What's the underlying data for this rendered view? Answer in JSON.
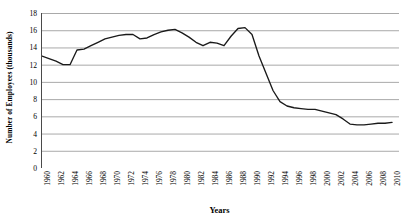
{
  "chart_data": {
    "type": "line",
    "title": "",
    "xlabel": "Years",
    "ylabel": "Number of Employees (thousands)",
    "xlim": [
      1960,
      2011
    ],
    "ylim": [
      0,
      18
    ],
    "ytick_step": 2,
    "grid": true,
    "grid_axis": "y",
    "legend": "none",
    "line_color": "#1a1a1a",
    "grid_color": "#9a9a9a",
    "axis_color": "#4a4a4a",
    "background_color": "#ffffff",
    "yticks": [
      0,
      2,
      4,
      6,
      8,
      10,
      12,
      14,
      16,
      18
    ],
    "xticks": [
      "1960",
      "1962",
      "1964",
      "1966",
      "1968",
      "1970",
      "1972",
      "1974",
      "1976",
      "1978",
      "1980",
      "1982",
      "1984",
      "1986",
      "1988",
      "1990",
      "1992",
      "1994",
      "1996",
      "1998",
      "2000",
      "2002",
      "2004",
      "2006",
      "2008",
      "2010"
    ],
    "xtick_interval": 2,
    "minor_tick_interval": 1,
    "x": [
      1960,
      1961,
      1962,
      1963,
      1964,
      1965,
      1966,
      1967,
      1968,
      1969,
      1970,
      1971,
      1972,
      1973,
      1974,
      1975,
      1976,
      1977,
      1978,
      1979,
      1980,
      1981,
      1982,
      1983,
      1984,
      1985,
      1986,
      1987,
      1988,
      1989,
      1990,
      1991,
      1992,
      1993,
      1994,
      1995,
      1996,
      1997,
      1998,
      1999,
      2000,
      2001,
      2002,
      2003,
      2004,
      2005,
      2006,
      2007,
      2008,
      2009,
      2010
    ],
    "values": [
      13.0,
      12.7,
      12.4,
      12.0,
      12.0,
      13.7,
      13.8,
      14.2,
      14.6,
      15.0,
      15.2,
      15.4,
      15.5,
      15.5,
      15.0,
      15.1,
      15.5,
      15.8,
      16.0,
      16.1,
      15.7,
      15.2,
      14.6,
      14.2,
      14.6,
      14.5,
      14.2,
      15.3,
      16.2,
      16.3,
      15.5,
      13.0,
      11.0,
      9.0,
      7.7,
      7.2,
      7.0,
      6.9,
      6.8,
      6.8,
      6.6,
      6.4,
      6.2,
      5.7,
      5.1,
      5.0,
      5.0,
      5.1,
      5.2,
      5.2,
      5.3
    ],
    "series": [
      {
        "name": "Number of Employees (thousands)",
        "values": [
          13.0,
          12.7,
          12.4,
          12.0,
          12.0,
          13.7,
          13.8,
          14.2,
          14.6,
          15.0,
          15.2,
          15.4,
          15.5,
          15.5,
          15.0,
          15.1,
          15.5,
          15.8,
          16.0,
          16.1,
          15.7,
          15.2,
          14.6,
          14.2,
          14.6,
          14.5,
          14.2,
          15.3,
          16.2,
          16.3,
          15.5,
          13.0,
          11.0,
          9.0,
          7.7,
          7.2,
          7.0,
          6.9,
          6.8,
          6.8,
          6.6,
          6.4,
          6.2,
          5.7,
          5.1,
          5.0,
          5.0,
          5.1,
          5.2,
          5.2,
          5.3
        ]
      }
    ]
  }
}
